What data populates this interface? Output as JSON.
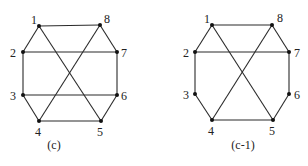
{
  "figures": [
    {
      "caption": "(c)",
      "caption_pos": [
        54,
        149
      ],
      "nodes": [
        {
          "id": "1",
          "x": 39,
          "y": 26,
          "lx": 31,
          "ly": 24
        },
        {
          "id": "2",
          "x": 23,
          "y": 52,
          "lx": 10,
          "ly": 57
        },
        {
          "id": "3",
          "x": 23,
          "y": 95,
          "lx": 10,
          "ly": 100
        },
        {
          "id": "4",
          "x": 39,
          "y": 121,
          "lx": 35,
          "ly": 136
        },
        {
          "id": "5",
          "x": 101,
          "y": 121,
          "lx": 97,
          "ly": 136
        },
        {
          "id": "6",
          "x": 117,
          "y": 95,
          "lx": 121,
          "ly": 100
        },
        {
          "id": "7",
          "x": 117,
          "y": 52,
          "lx": 121,
          "ly": 57
        },
        {
          "id": "8",
          "x": 100,
          "y": 25,
          "lx": 104,
          "ly": 23
        }
      ],
      "edges": [
        [
          "1",
          "8"
        ],
        [
          "1",
          "2"
        ],
        [
          "1",
          "5"
        ],
        [
          "8",
          "7"
        ],
        [
          "8",
          "4"
        ],
        [
          "2",
          "7"
        ],
        [
          "2",
          "3"
        ],
        [
          "7",
          "6"
        ],
        [
          "3",
          "6"
        ],
        [
          "3",
          "4"
        ],
        [
          "6",
          "5"
        ],
        [
          "4",
          "5"
        ]
      ]
    },
    {
      "caption": "(c-1)",
      "caption_pos": [
        243,
        149
      ],
      "nodes": [
        {
          "id": "1",
          "x": 212,
          "y": 25,
          "lx": 204,
          "ly": 23
        },
        {
          "id": "2",
          "x": 195,
          "y": 52,
          "lx": 183,
          "ly": 57
        },
        {
          "id": "3",
          "x": 195,
          "y": 94,
          "lx": 183,
          "ly": 99
        },
        {
          "id": "4",
          "x": 212,
          "y": 120,
          "lx": 208,
          "ly": 135
        },
        {
          "id": "5",
          "x": 273,
          "y": 120,
          "lx": 269,
          "ly": 135
        },
        {
          "id": "6",
          "x": 289,
          "y": 94,
          "lx": 294,
          "ly": 99
        },
        {
          "id": "7",
          "x": 289,
          "y": 52,
          "lx": 294,
          "ly": 57
        },
        {
          "id": "8",
          "x": 272,
          "y": 25,
          "lx": 277,
          "ly": 22
        }
      ],
      "edges": [
        [
          "1",
          "8"
        ],
        [
          "1",
          "2"
        ],
        [
          "1",
          "5"
        ],
        [
          "8",
          "7"
        ],
        [
          "8",
          "4"
        ],
        [
          "2",
          "7"
        ],
        [
          "2",
          "3"
        ],
        [
          "7",
          "6"
        ],
        [
          "3",
          "4"
        ],
        [
          "6",
          "5"
        ],
        [
          "4",
          "5"
        ]
      ]
    }
  ]
}
